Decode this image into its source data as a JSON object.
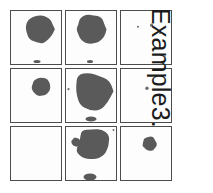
{
  "figure": {
    "caption": "Example3.",
    "caption_rotation_deg": 90,
    "background_color": "#ffffff",
    "panel_border_color": "#4c4c4c",
    "panel_background_color": "#fdfdfd",
    "blob_color": "#5a5a5a",
    "speck_color": "#6e6e6e",
    "grid": {
      "rows": 3,
      "columns": 3
    }
  },
  "panels": [
    {
      "id": "panel-r1c1",
      "row": 1,
      "column": 1,
      "description": "large rounded blob upper-right of center, small nub at bottom edge",
      "shapes": [
        {
          "type": "blob",
          "cx": 58,
          "cy": 36,
          "r": 28,
          "seed": 11
        },
        {
          "type": "nub",
          "cx": 52,
          "cy": 100,
          "rx": 7,
          "ry": 3
        }
      ]
    },
    {
      "id": "panel-r1c2",
      "row": 1,
      "column": 2,
      "description": "large rounded blob centered slightly high",
      "shapes": [
        {
          "type": "blob",
          "cx": 50,
          "cy": 36,
          "r": 29,
          "seed": 23
        },
        {
          "type": "nub",
          "cx": 48,
          "cy": 100,
          "rx": 6,
          "ry": 3
        }
      ]
    },
    {
      "id": "panel-r1c3",
      "row": 1,
      "column": 3,
      "description": "mostly empty, a few faint specks near the top",
      "shapes": [
        {
          "type": "speck",
          "cx": 34,
          "cy": 31,
          "r": 2.0
        },
        {
          "type": "speck",
          "cx": 61,
          "cy": 28,
          "r": 3.0
        },
        {
          "type": "speck",
          "cx": 78,
          "cy": 44,
          "r": 1.8
        },
        {
          "type": "speck",
          "cx": 88,
          "cy": 90,
          "r": 1.2
        }
      ]
    },
    {
      "id": "panel-r2c1",
      "row": 2,
      "column": 1,
      "description": "medium rounded blob right of center, upper half",
      "shapes": [
        {
          "type": "blob",
          "cx": 60,
          "cy": 35,
          "r": 18,
          "seed": 37
        }
      ]
    },
    {
      "id": "panel-r2c2",
      "row": 2,
      "column": 2,
      "description": "very large angular blob filling most of the panel, plus a bump at the bottom edge",
      "shapes": [
        {
          "type": "angular",
          "cx": 52,
          "cy": 44,
          "r": 38,
          "seed": 5
        },
        {
          "type": "nub",
          "cx": 50,
          "cy": 99,
          "rx": 11,
          "ry": 5
        },
        {
          "type": "speck",
          "cx": 5,
          "cy": 40,
          "r": 2.2
        }
      ]
    },
    {
      "id": "panel-r2c3",
      "row": 2,
      "column": 3,
      "description": "single small dot left of center",
      "shapes": [
        {
          "type": "speck",
          "cx": 52,
          "cy": 38,
          "r": 3.4
        }
      ]
    },
    {
      "id": "panel-r3c1",
      "row": 3,
      "column": 1,
      "description": "empty panel",
      "shapes": []
    },
    {
      "id": "panel-r3c2",
      "row": 3,
      "column": 2,
      "description": "large angular blob upper area with a left lobe, plus a bump at the bottom edge",
      "shapes": [
        {
          "type": "angular",
          "cx": 56,
          "cy": 36,
          "r": 34,
          "seed": 71
        },
        {
          "type": "blob",
          "cx": 20,
          "cy": 30,
          "r": 9,
          "seed": 13
        },
        {
          "type": "nub",
          "cx": 48,
          "cy": 99,
          "rx": 13,
          "ry": 7
        },
        {
          "type": "speck",
          "cx": 95,
          "cy": 6,
          "r": 2.0
        }
      ]
    },
    {
      "id": "panel-r3c3",
      "row": 3,
      "column": 3,
      "description": "small-medium rounded blob above and right of center",
      "shapes": [
        {
          "type": "blob",
          "cx": 57,
          "cy": 33,
          "r": 14,
          "seed": 91
        }
      ]
    }
  ]
}
